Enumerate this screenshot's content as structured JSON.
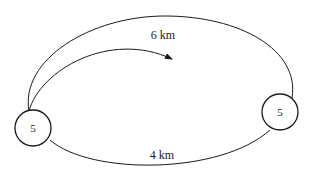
{
  "diagram": {
    "nodes": [
      {
        "id": "left",
        "label": "5",
        "cx": 33,
        "cy": 128,
        "r": 18
      },
      {
        "id": "right",
        "label": "5",
        "cx": 280,
        "cy": 112,
        "r": 18
      }
    ],
    "edges": [
      {
        "id": "top",
        "label": "6 km"
      },
      {
        "id": "bottom",
        "label": "4 km"
      }
    ],
    "arrow": {
      "direction": "clockwise"
    },
    "colors": {
      "stroke": "#1a1a1a",
      "background": "#ffffff"
    }
  }
}
